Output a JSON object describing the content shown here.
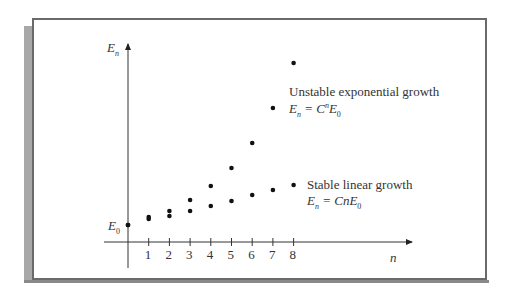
{
  "chart_data": {
    "type": "scatter",
    "title": "",
    "xlabel": "n",
    "ylabel": "E_n",
    "x_ticks": [
      "1",
      "2",
      "3",
      "4",
      "5",
      "6",
      "7",
      "8"
    ],
    "y_tick_label": "E_0",
    "grid": false,
    "origin": {
      "n": 0,
      "label": "E_0"
    },
    "series": [
      {
        "name": "Unstable exponential growth",
        "formula": "E_n = C^n E_0",
        "x": [
          0,
          1,
          2,
          3,
          4,
          5,
          6,
          7,
          8
        ],
        "values_px_y": [
          225,
          217,
          211,
          200,
          186,
          168,
          143,
          108,
          63
        ]
      },
      {
        "name": "Stable linear growth",
        "formula": "E_n = CnE_0",
        "x": [
          0,
          1,
          2,
          3,
          4,
          5,
          6,
          7,
          8
        ],
        "values_px_y": [
          225,
          219,
          216,
          211,
          206,
          201,
          195,
          190,
          185
        ]
      }
    ]
  },
  "labels": {
    "y_axis": "E",
    "y_axis_sub": "n",
    "x_axis": "n",
    "origin": "E",
    "origin_sub": "0",
    "exp_title": "Unstable exponential growth",
    "exp_formula_lhs": "E",
    "exp_formula_lhs_sub": "n",
    "exp_formula_rhs": " = C",
    "exp_formula_sup": "n",
    "exp_formula_tail": "E",
    "exp_formula_tail_sub": "0",
    "lin_title": "Stable linear growth",
    "lin_formula_lhs": "E",
    "lin_formula_lhs_sub": "n",
    "lin_formula_rhs": " = CnE",
    "lin_formula_tail_sub": "0"
  }
}
